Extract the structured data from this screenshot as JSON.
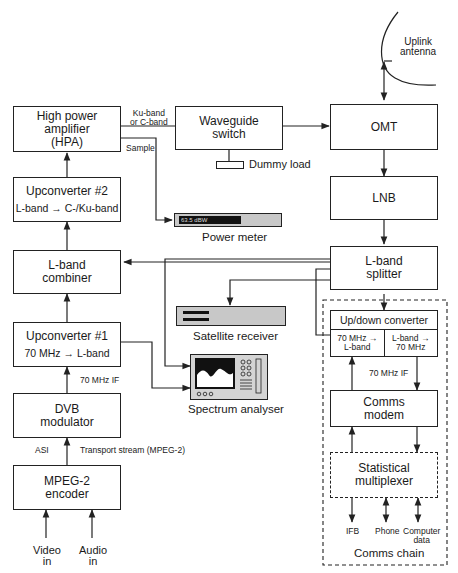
{
  "diagram": {
    "blocks": {
      "hpa": {
        "line1": "High power",
        "line2": "amplifier",
        "line3": "(HPA)"
      },
      "upconverter2": {
        "title": "Upconverter #2",
        "sub_from": "L-band",
        "sub_to": "C-/Ku-band"
      },
      "lband_combiner": {
        "line1": "L-band",
        "line2": "combiner"
      },
      "upconverter1": {
        "title": "Upconverter #1",
        "sub_from": "70 MHz",
        "sub_to": "L-band"
      },
      "dvb_modulator": {
        "line1": "DVB",
        "line2": "modulator"
      },
      "mpeg2_encoder": {
        "line1": "MPEG-2",
        "line2": "encoder"
      },
      "waveguide_switch": {
        "line1": "Waveguide",
        "line2": "switch"
      },
      "omt": {
        "label": "OMT"
      },
      "lnb": {
        "label": "LNB"
      },
      "lband_splitter": {
        "line1": "L-band",
        "line2": "splitter"
      },
      "updown_converter": {
        "title": "Up/down converter",
        "left_l1": "70 MHz →",
        "left_l2": "L-band",
        "right_l1": "L-band →",
        "right_l2": "70 MHz"
      },
      "comms_modem": {
        "line1": "Comms",
        "line2": "modem"
      },
      "stat_mux": {
        "line1": "Statistical",
        "line2": "multiplexer"
      }
    },
    "devices": {
      "power_meter": {
        "caption": "Power meter",
        "reading": "63.5 dBW"
      },
      "satellite_receiver": {
        "caption": "Satellite receiver"
      },
      "spectrum_analyser": {
        "caption": "Spectrum analyser"
      },
      "uplink_antenna": {
        "line1": "Uplink",
        "line2": "antenna"
      },
      "dummy_load": {
        "caption": "Dummy load"
      }
    },
    "labels": {
      "ku_c_band_1": "Ku-band",
      "ku_c_band_2": "or C-band",
      "sample": "Sample",
      "if_70_left": "70 MHz IF",
      "if_70_right": "70 MHz IF",
      "asi": "ASI",
      "transport_stream": "Transport stream (MPEG-2)",
      "video_in_1": "Video",
      "video_in_2": "in",
      "audio_in_1": "Audio",
      "audio_in_2": "in",
      "ifb": "IFB",
      "phone": "Phone",
      "computer_data_1": "Computer",
      "computer_data_2": "data",
      "comms_chain": "Comms chain"
    },
    "arrow_glyph": "→"
  }
}
